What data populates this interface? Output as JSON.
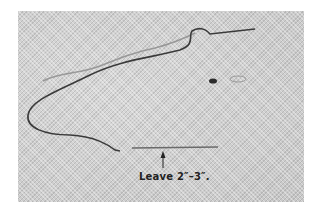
{
  "image": {
    "description": "Photograph of a threaded needle on woven fabric, with a loose thread tail",
    "background_color": "#ffffff",
    "fabric_color": "#cfcfcf",
    "thread_color": "#3a3a3a",
    "needle_color": "#6a6a6a"
  },
  "annotation": {
    "label": "Leave 2″–3″.",
    "arrow": "up-arrow pointing to thread tail"
  }
}
